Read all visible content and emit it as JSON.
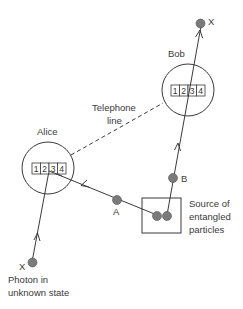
{
  "diagram": {
    "bob": {
      "label": "Bob",
      "register": [
        "1",
        "2",
        "3",
        "4"
      ]
    },
    "alice": {
      "label": "Alice",
      "register": [
        "1",
        "2",
        "3",
        "4"
      ]
    },
    "telephone_line": {
      "line1": "Telephone",
      "line2": "line"
    },
    "source": {
      "line1": "Source of",
      "line2": "entangled",
      "line3": "particles"
    },
    "particles": {
      "a_label": "A",
      "b_label": "B",
      "x_top_label": "X",
      "x_bottom_label": "X"
    },
    "photon": {
      "line1": "Photon in",
      "line2": "unknown state"
    }
  }
}
